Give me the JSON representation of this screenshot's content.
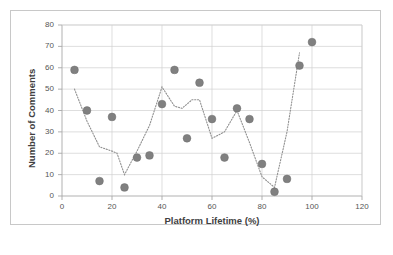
{
  "figure": {
    "border_color": "#c8c8c8",
    "background": "#ffffff"
  },
  "chart_data": {
    "type": "scatter",
    "title": "",
    "xlabel": "Platform Lifetime (%)",
    "ylabel": "Number of Comments",
    "xlim": [
      0,
      120
    ],
    "ylim": [
      0,
      80
    ],
    "xticks": [
      0,
      20,
      40,
      60,
      80,
      100,
      120
    ],
    "yticks": [
      0,
      10,
      20,
      30,
      40,
      50,
      60,
      70,
      80
    ],
    "grid": "both",
    "legend": "none",
    "marker_color": "#808080",
    "marker_shape": "circle",
    "marker_size": 5,
    "trendline": {
      "style": "dotted",
      "color": "#909090",
      "description": "dotted moving-average line through the points"
    },
    "x": [
      5,
      10,
      15,
      20,
      25,
      30,
      35,
      40,
      45,
      50,
      55,
      60,
      65,
      70,
      75,
      80,
      85,
      90,
      95,
      100
    ],
    "y": [
      59,
      40,
      7,
      37,
      4,
      18,
      19,
      43,
      59,
      27,
      53,
      36,
      18,
      41,
      36,
      15,
      2,
      8,
      61,
      72
    ],
    "points": [
      {
        "x": 5,
        "y": 59
      },
      {
        "x": 10,
        "y": 40
      },
      {
        "x": 15,
        "y": 7
      },
      {
        "x": 20,
        "y": 37
      },
      {
        "x": 25,
        "y": 4
      },
      {
        "x": 30,
        "y": 18
      },
      {
        "x": 35,
        "y": 19
      },
      {
        "x": 40,
        "y": 43
      },
      {
        "x": 45,
        "y": 59
      },
      {
        "x": 50,
        "y": 27
      },
      {
        "x": 55,
        "y": 53
      },
      {
        "x": 60,
        "y": 36
      },
      {
        "x": 65,
        "y": 18
      },
      {
        "x": 70,
        "y": 41
      },
      {
        "x": 75,
        "y": 36
      },
      {
        "x": 80,
        "y": 15
      },
      {
        "x": 85,
        "y": 2
      },
      {
        "x": 90,
        "y": 8
      },
      {
        "x": 95,
        "y": 61
      },
      {
        "x": 100,
        "y": 72
      }
    ],
    "trend_points": [
      {
        "x": 5,
        "y": 50
      },
      {
        "x": 10,
        "y": 35
      },
      {
        "x": 15,
        "y": 23
      },
      {
        "x": 20,
        "y": 21
      },
      {
        "x": 22,
        "y": 20
      },
      {
        "x": 25,
        "y": 10
      },
      {
        "x": 30,
        "y": 21
      },
      {
        "x": 35,
        "y": 33
      },
      {
        "x": 40,
        "y": 51
      },
      {
        "x": 45,
        "y": 42
      },
      {
        "x": 48,
        "y": 41
      },
      {
        "x": 52,
        "y": 45
      },
      {
        "x": 55,
        "y": 45
      },
      {
        "x": 60,
        "y": 27
      },
      {
        "x": 65,
        "y": 30
      },
      {
        "x": 70,
        "y": 40
      },
      {
        "x": 75,
        "y": 25
      },
      {
        "x": 80,
        "y": 9
      },
      {
        "x": 85,
        "y": 4
      },
      {
        "x": 90,
        "y": 30
      },
      {
        "x": 95,
        "y": 67
      }
    ]
  }
}
